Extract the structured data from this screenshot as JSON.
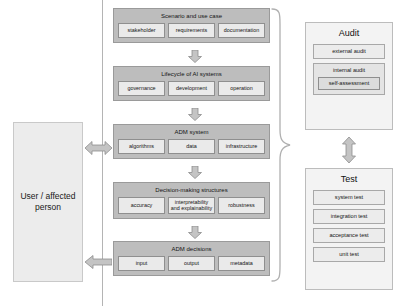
{
  "actor": {
    "label": "User / affected person"
  },
  "flow": {
    "blocks": [
      {
        "title": "Scenario and use case",
        "items": [
          "stakeholder",
          "requirements",
          "documentation"
        ]
      },
      {
        "title": "Lifecycle of AI systems",
        "items": [
          "governance",
          "development",
          "operation"
        ]
      },
      {
        "title": "ADM system",
        "items": [
          "algorithms",
          "data",
          "infrastructure"
        ]
      },
      {
        "title": "Decision-making structures",
        "items": [
          "accuracy",
          "interpretability and explainability",
          "robustness"
        ]
      },
      {
        "title": "ADM decisions",
        "items": [
          "input",
          "output",
          "metadata"
        ]
      }
    ]
  },
  "audit": {
    "title": "Audit",
    "external_label": "external audit",
    "internal_label": "internal audit",
    "self_assessment_label": "self-assessment"
  },
  "test": {
    "title": "Test",
    "items": [
      "system test",
      "integration test",
      "acceptance test",
      "unit test"
    ]
  },
  "colors": {
    "block_fill": "#bdbdbd",
    "item_fill": "#eaeaea",
    "panel_fill": "#f3f3f3",
    "actor_fill": "#ececec",
    "arrow_fill": "#c4c4c4",
    "arrow_stroke": "#8d8d8d",
    "rule": "#b4b4b4"
  }
}
